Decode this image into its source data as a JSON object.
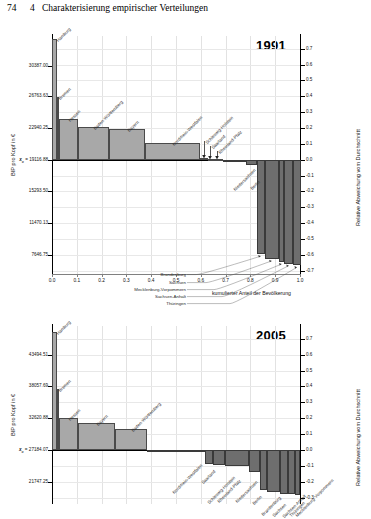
{
  "page": {
    "folio": "74",
    "chapter_number": "4",
    "chapter_title": "Charakterisierung empirischer Verteilungen"
  },
  "chart_data": [
    {
      "type": "bar",
      "title": "1991",
      "xlabel": "kumulierter Anteil der Bevölkerung",
      "ylabel": "BIP pro Kopf in €",
      "ylabel_right": "Relative Abweichung vom Durchschnitt",
      "mean_label": "19116.88",
      "mean_prefix": "x",
      "mean_subscript": "ø",
      "xlim": [
        0.0,
        1.0
      ],
      "xticks": [
        "0.0",
        "0.1",
        "0.2",
        "0.3",
        "0.4",
        "0.5",
        "0.6",
        "0.7",
        "0.8",
        "0.9",
        "1.0"
      ],
      "yticks_left": [
        "30387.00",
        "26763.63",
        "22940.25",
        "19116.88",
        "15293.50",
        "11470.13",
        "7646.75"
      ],
      "yticks_left_values": [
        0.59,
        0.4,
        0.2,
        0.0,
        -0.2,
        -0.4,
        -0.6
      ],
      "yticks_right": [
        "0.7",
        "0.6",
        "0.5",
        "0.4",
        "0.3",
        "0.2",
        "0.1",
        "0.0",
        "-0.1",
        "-0.2",
        "-0.3",
        "-0.4",
        "-0.5",
        "-0.6",
        "-0.7"
      ],
      "ylim_right": [
        -0.72,
        0.78
      ],
      "grid": true,
      "legend": "none",
      "bars": [
        {
          "label": "Hamburg",
          "width": 0.021,
          "value": 0.76
        },
        {
          "label": "Bremen",
          "width": 0.009,
          "value": 0.395
        },
        {
          "label": "Hessen",
          "width": 0.073,
          "value": 0.255
        },
        {
          "label": "Baden-Württemberg",
          "width": 0.126,
          "value": 0.205
        },
        {
          "label": "Bayern",
          "width": 0.146,
          "value": 0.195
        },
        {
          "label": "Nordrhein-Westfalen",
          "width": 0.221,
          "value": 0.105
        },
        {
          "label": "Schleswig-Holstein",
          "width": 0.033,
          "value": 0.01
        },
        {
          "label": "Saarland",
          "width": 0.013,
          "value": 0.006
        },
        {
          "label": "Rheinland-Pfalz",
          "width": 0.047,
          "value": 0.004
        },
        {
          "label": "Niedersachsen",
          "width": 0.094,
          "value": -0.015
        },
        {
          "label": "Berlin",
          "width": 0.043,
          "value": -0.03
        },
        {
          "label": "Brandenburg",
          "width": 0.031,
          "value": -0.595
        },
        {
          "label": "Sachsen",
          "width": 0.057,
          "value": -0.625
        },
        {
          "label": "Mecklenburg-Vorpommern",
          "width": 0.023,
          "value": -0.645
        },
        {
          "label": "Sachsen-Anhalt",
          "width": 0.035,
          "value": -0.655
        },
        {
          "label": "Thüringen",
          "width": 0.031,
          "value": -0.665
        }
      ]
    },
    {
      "type": "bar",
      "title": "2005",
      "xlabel": "kumulierter Anteil der Bevölkerung",
      "ylabel": "BIP pro Kopf in €",
      "ylabel_right": "Relative Abweichung vom Durchschnitt",
      "mean_label": "27184.07",
      "mean_prefix": "x",
      "mean_subscript": "ø",
      "xlim": [
        0.0,
        1.0
      ],
      "xticks": [
        "0.0",
        "0.1",
        "0.2",
        "0.3",
        "0.4",
        "0.5",
        "0.6",
        "0.7",
        "0.8",
        "0.9",
        "1.0"
      ],
      "yticks_left": [
        "43494.51",
        "38057.69",
        "32620.88",
        "27184.07",
        "21747.25"
      ],
      "yticks_left_values": [
        0.6,
        0.4,
        0.2,
        0.0,
        -0.2
      ],
      "yticks_right": [
        "0.7",
        "0.6",
        "0.5",
        "0.4",
        "0.3",
        "0.2",
        "0.1",
        "0.0",
        "-0.1",
        "-0.2",
        "-0.3"
      ],
      "ylim_right": [
        -0.34,
        0.78
      ],
      "grid": true,
      "legend": "none",
      "bars": [
        {
          "label": "Hamburg",
          "width": 0.021,
          "value": 0.745
        },
        {
          "label": "Bremen",
          "width": 0.008,
          "value": 0.385
        },
        {
          "label": "Hessen",
          "width": 0.074,
          "value": 0.2
        },
        {
          "label": "Bayern",
          "width": 0.151,
          "value": 0.17
        },
        {
          "label": "Baden-Württemberg",
          "width": 0.13,
          "value": 0.13
        },
        {
          "label": "Nordrhein-Westfalen",
          "width": 0.219,
          "value": -0.002
        },
        {
          "label": "Saarland",
          "width": 0.013,
          "value": -0.01
        },
        {
          "label": "Schleswig-Holstein",
          "width": 0.034,
          "value": -0.09
        },
        {
          "label": "Rheinland-Pfalz",
          "width": 0.049,
          "value": -0.095
        },
        {
          "label": "Niedersachsen",
          "width": 0.097,
          "value": -0.1
        },
        {
          "label": "Berlin",
          "width": 0.041,
          "value": -0.14
        },
        {
          "label": "Brandenburg",
          "width": 0.031,
          "value": -0.255
        },
        {
          "label": "Sachsen",
          "width": 0.052,
          "value": -0.265
        },
        {
          "label": "Sachsen-Anhalt",
          "width": 0.03,
          "value": -0.275
        },
        {
          "label": "Thüringen",
          "width": 0.028,
          "value": -0.28
        },
        {
          "label": "Mecklenburg-Vorpommern",
          "width": 0.021,
          "value": -0.285
        }
      ]
    }
  ]
}
